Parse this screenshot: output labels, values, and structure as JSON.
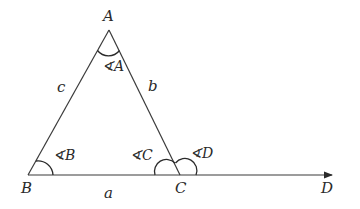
{
  "diagram": {
    "type": "triangle-with-exterior-angle",
    "vertices": {
      "A": {
        "label": "A",
        "x": 109,
        "y": 30
      },
      "B": {
        "label": "B",
        "x": 28,
        "y": 175
      },
      "C": {
        "label": "C",
        "x": 180,
        "y": 175
      },
      "D": {
        "label": "D",
        "x": 330,
        "y": 175
      }
    },
    "sides": {
      "a": {
        "label": "a"
      },
      "b": {
        "label": "b"
      },
      "c": {
        "label": "c"
      }
    },
    "angles": {
      "A": {
        "label": "∢A"
      },
      "B": {
        "label": "∢B"
      },
      "C": {
        "label": "∢C"
      },
      "D": {
        "label": "∢D"
      }
    },
    "colors": {
      "stroke": "#3a3a3a",
      "text": "#2a2a2a",
      "background": "#ffffff"
    }
  }
}
